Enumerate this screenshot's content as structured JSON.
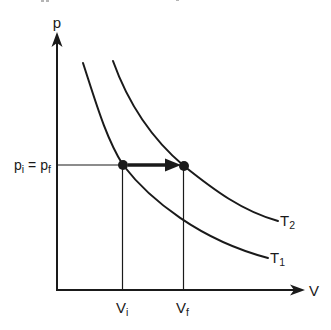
{
  "figure": {
    "background": "#ffffff",
    "ink_color": "#1a1a1a",
    "axes": {
      "y_label": "p",
      "x_label": "V"
    },
    "pressure_label": {
      "base_i": "p",
      "sub_i": "i",
      "equals": "=",
      "base_f": "p",
      "sub_f": "f"
    },
    "volume_ticks": {
      "vi_base": "V",
      "vi_sub": "i",
      "vf_base": "V",
      "vf_sub": "f"
    },
    "isotherms": {
      "t1_base": "T",
      "t1_sub": "1",
      "t2_base": "T",
      "t2_sub": "2"
    }
  }
}
